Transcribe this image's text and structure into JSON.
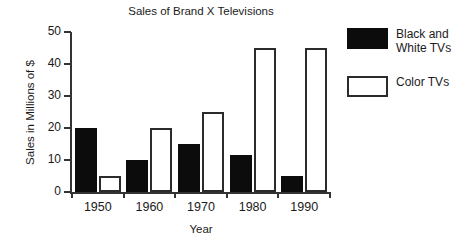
{
  "chart_data": {
    "type": "bar",
    "title": "Sales of Brand X Televisions",
    "xlabel": "Year",
    "ylabel": "Sales in Millions of $",
    "categories": [
      "1950",
      "1960",
      "1970",
      "1980",
      "1990"
    ],
    "series": [
      {
        "name": "Black and White TVs",
        "color": "#0c0c0c",
        "fill": "solid-black",
        "values": [
          20,
          10,
          15,
          11.5,
          5
        ]
      },
      {
        "name": "Color TVs",
        "color": "#ffffff",
        "fill": "white-outlined",
        "values": [
          5,
          20,
          25,
          45,
          45
        ]
      }
    ],
    "ylim": [
      0,
      50
    ],
    "yticks": [
      0,
      10,
      20,
      30,
      40,
      50
    ],
    "ytick_labels": [
      "0",
      "10",
      "20",
      "30",
      "40",
      "50"
    ],
    "grid": false,
    "legend_position": "right",
    "legend": [
      {
        "label": "Black and\nWhite TVs",
        "swatch": "bw"
      },
      {
        "label": "Color TVs",
        "swatch": "color"
      }
    ]
  }
}
